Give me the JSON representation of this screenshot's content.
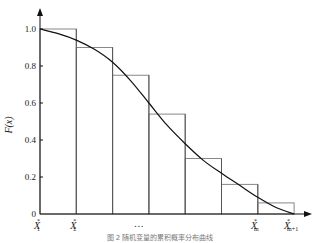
{
  "chart_data": {
    "type": "bar",
    "title": "",
    "ylabel": "F(x)",
    "xlabel": "",
    "ylim": [
      0,
      1.0
    ],
    "yticks": [
      "0",
      "0.2",
      "0.4",
      "0.6",
      "0.8",
      "1.0"
    ],
    "ytick_values": [
      0,
      0.2,
      0.4,
      0.6,
      0.8,
      1.0
    ],
    "x_tick_labels": [
      {
        "main": "X",
        "sup": "*",
        "sub": "1",
        "index": 0
      },
      {
        "main": "X",
        "sup": "*",
        "sub": "2",
        "index": 1
      },
      {
        "main": "…",
        "sup": "",
        "sub": "",
        "index": 3
      },
      {
        "main": "X",
        "sup": "*",
        "sub": "m",
        "index": 6
      },
      {
        "main": "X",
        "sup": "*",
        "sub": "m+1",
        "index": 7
      }
    ],
    "bins": 7,
    "values": [
      1.0,
      0.9,
      0.75,
      0.54,
      0.3,
      0.16,
      0.06
    ],
    "curve": {
      "name": "F(x)",
      "x": [
        0,
        0.5,
        1,
        1.5,
        2,
        2.5,
        3,
        3.5,
        4,
        4.5,
        5,
        5.5,
        6,
        6.5,
        7
      ],
      "y": [
        1.0,
        0.975,
        0.94,
        0.89,
        0.82,
        0.72,
        0.6,
        0.48,
        0.38,
        0.29,
        0.22,
        0.155,
        0.09,
        0.035,
        0.0
      ]
    },
    "grid": false,
    "legend": "none",
    "caption": "图 2  随机变量的累积概率分布曲线"
  }
}
